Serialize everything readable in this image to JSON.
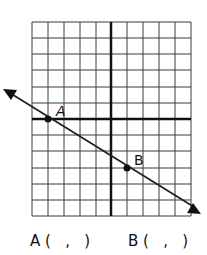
{
  "diagram": {
    "type": "coordinate-plane",
    "grid": {
      "columns": 10,
      "rows": 12,
      "x_range": [
        -5,
        5
      ],
      "y_range": [
        -6,
        6
      ]
    },
    "line": {
      "direction": "two-headed arrow",
      "slope": -0.6
    },
    "points": [
      {
        "label": "A",
        "x": -4,
        "y": 0
      },
      {
        "label": "B",
        "x": 1,
        "y": -3
      }
    ]
  },
  "answers": {
    "a_label": "A (   ,   )",
    "b_label": "B (   ,   )"
  },
  "colors": {
    "grid": "#333333",
    "axis": "#111111",
    "line": "#222222"
  }
}
